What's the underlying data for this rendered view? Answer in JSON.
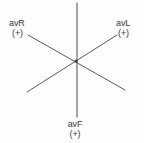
{
  "diagram": {
    "background_color": "#fdfdfd",
    "line_color": "#5a5a5a",
    "text_color": "#3b3b3b",
    "center": {
      "x": 76,
      "y": 61
    },
    "leads": [
      {
        "id": "avr",
        "name": "avR",
        "polarity": "(+)",
        "position": "upper-left",
        "positive_end": {
          "x": 28,
          "y": 35
        },
        "negative_end": {
          "x": 125,
          "y": 90
        }
      },
      {
        "id": "avl",
        "name": "avL",
        "polarity": "(+)",
        "position": "upper-right",
        "positive_end": {
          "x": 117,
          "y": 35
        },
        "negative_end": {
          "x": 27,
          "y": 92
        }
      },
      {
        "id": "avf",
        "name": "avF",
        "polarity": "(+)",
        "position": "bottom",
        "positive_end": {
          "x": 77,
          "y": 117
        },
        "negative_end": {
          "x": 77,
          "y": 3
        }
      }
    ]
  }
}
